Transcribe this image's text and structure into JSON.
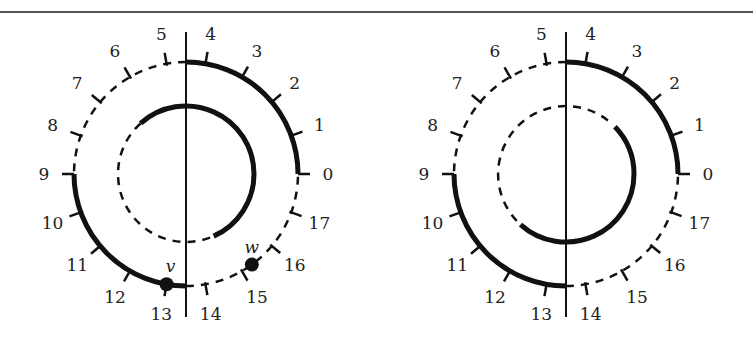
{
  "diagrams": [
    {
      "id": "left",
      "center": [
        186,
        174
      ],
      "outer_radius": 112,
      "inner_radius": 68,
      "tick_labels": [
        "0",
        "1",
        "2",
        "3",
        "4",
        "5",
        "6",
        "7",
        "8",
        "9",
        "10",
        "11",
        "12",
        "13",
        "14",
        "15",
        "16",
        "17"
      ],
      "outer_solid_segments": [
        [
          0,
          4.5
        ],
        [
          9,
          13.5
        ]
      ],
      "outer_dashed_segments": [
        [
          4.5,
          9
        ],
        [
          13.5,
          18
        ]
      ],
      "inner_solid_arc": "from ~6.5 clockwise through 4.5 down to ~16",
      "inner_dashed_arc": "from ~16 through 13.5 and 9 back to ~6.5",
      "points": [
        {
          "label": "v",
          "position": 13
        },
        {
          "label": "w",
          "position": 15.3
        }
      ]
    },
    {
      "id": "right",
      "center": [
        566,
        174
      ],
      "outer_radius": 112,
      "inner_radius": 68,
      "tick_labels": [
        "0",
        "1",
        "2",
        "3",
        "4",
        "5",
        "6",
        "7",
        "8",
        "9",
        "10",
        "11",
        "12",
        "13",
        "14",
        "15",
        "16",
        "17"
      ],
      "outer_solid_segments": [
        [
          0,
          4.5
        ],
        [
          9,
          13.5
        ]
      ],
      "outer_dashed_segments": [
        [
          4.5,
          9
        ],
        [
          13.5,
          18
        ]
      ],
      "inner_solid_arc": "from ~2 clockwise down through 0 to 13.5 and ~11.5",
      "inner_dashed_arc": "from ~11.5 through 9 and 4.5 back to ~2",
      "points": []
    }
  ],
  "labels": {
    "v": "v",
    "w": "w"
  }
}
